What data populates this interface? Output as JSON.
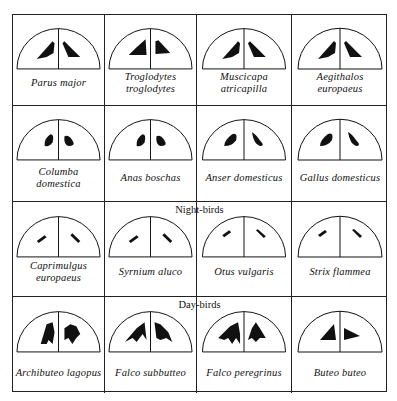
{
  "figure": {
    "groups": [
      {
        "header": "",
        "birds": [
          {
            "name": "Parus major",
            "lines": [
              "Parus major"
            ],
            "field_shape": "wedge-wide"
          },
          {
            "name": "Troglodytes troglodytes",
            "lines": [
              "Troglodytes",
              "troglodytes"
            ],
            "field_shape": "wedge-blocky"
          },
          {
            "name": "Muscicapa atricapilla",
            "lines": [
              "Muscicapa",
              "atricapilla"
            ],
            "field_shape": "wedge-wide"
          },
          {
            "name": "Aegithalos europaeus",
            "lines": [
              "Aegithalos",
              "europaeus"
            ],
            "field_shape": "wedge-wide"
          }
        ]
      },
      {
        "header": "",
        "birds": [
          {
            "name": "Columba domestica",
            "lines": [
              "Columba",
              "domestica"
            ],
            "field_shape": "blob-small"
          },
          {
            "name": "Anas boschas",
            "lines": [
              "Anas boschas"
            ],
            "field_shape": "blob-small"
          },
          {
            "name": "Anser domesticus",
            "lines": [
              "Anser domesticus"
            ],
            "field_shape": "blob-elongated"
          },
          {
            "name": "Gallus domesticus",
            "lines": [
              "Gallus domesticus"
            ],
            "field_shape": "blob-elongated"
          }
        ]
      },
      {
        "header": "Night-birds",
        "birds": [
          {
            "name": "Caprimulgus europaeus",
            "lines": [
              "Caprimulgus",
              "europaeus"
            ],
            "field_shape": "dash"
          },
          {
            "name": "Syrnium aluco",
            "lines": [
              "Syrnium aluco"
            ],
            "field_shape": "dash"
          },
          {
            "name": "Otus vulgaris",
            "lines": [
              "Otus vulgaris"
            ],
            "field_shape": "dash-thin"
          },
          {
            "name": "Strix flammea",
            "lines": [
              "Strix flammea"
            ],
            "field_shape": "dash-thin"
          }
        ]
      },
      {
        "header": "Day-birds",
        "birds": [
          {
            "name": "Archibuteo lagopus",
            "lines": [
              "Archibuteo lagopus"
            ],
            "field_shape": "fan-branched"
          },
          {
            "name": "Falco subbutteo",
            "lines": [
              "Falco subbutteo"
            ],
            "field_shape": "fan-rays"
          },
          {
            "name": "Falco peregrinus",
            "lines": [
              "Falco peregrinus"
            ],
            "field_shape": "fan-comb"
          },
          {
            "name": "Buteo buteo",
            "lines": [
              "Buteo buteo"
            ],
            "field_shape": "triangle"
          }
        ]
      }
    ],
    "colors": {
      "ink": "#111111",
      "background": "#ffffff"
    }
  }
}
